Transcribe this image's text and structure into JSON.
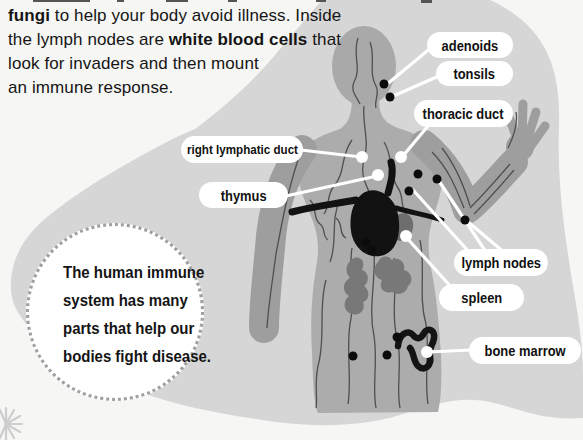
{
  "intro": {
    "l1_bold": "fungi",
    "l1_rest": " to help your body avoid illness. Inside",
    "l2_pre": "the lymph nodes are ",
    "l2_bold": "white blood cells",
    "l2_post": " that",
    "l3": "look for invaders and then mount",
    "l4": "an immune response."
  },
  "labels": {
    "adenoids": "adenoids",
    "tonsils": "tonsils",
    "thoracic_duct": "thoracic duct",
    "right_lymphatic_duct": "right lymphatic duct",
    "thymus": "thymus",
    "lymph_nodes": "lymph nodes",
    "spleen": "spleen",
    "bone_marrow": "bone marrow"
  },
  "callout": {
    "l1": "The human immune",
    "l2": "system has many",
    "l3": "parts that help our",
    "l4": "bodies fight disease."
  },
  "colors": {
    "page": "#f6f6f4",
    "background_blob": "#d6d6d6",
    "body_silhouette": "#acacac",
    "organ_gray": "#787878",
    "thymus_black": "#121212",
    "node_dot": "#0c0c0c",
    "label_pill": "#ffffff",
    "leader_line": "#ffffff"
  }
}
